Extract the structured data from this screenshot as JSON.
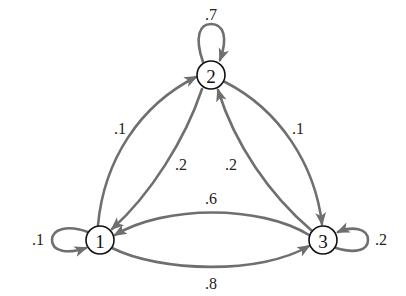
{
  "diagram": {
    "type": "markov-chain-state-diagram",
    "edge_color": "#6f6f6f",
    "node_stroke_color": "#111111",
    "nodes": [
      {
        "id": "1",
        "label": "1",
        "x": 100,
        "y": 240
      },
      {
        "id": "2",
        "label": "2",
        "x": 211,
        "y": 75
      },
      {
        "id": "3",
        "label": "3",
        "x": 323,
        "y": 240
      }
    ],
    "edges": [
      {
        "from": "2",
        "to": "2",
        "label": ".7"
      },
      {
        "from": "1",
        "to": "2",
        "label": ".1"
      },
      {
        "from": "2",
        "to": "1",
        "label": ".2"
      },
      {
        "from": "2",
        "to": "3",
        "label": ".1"
      },
      {
        "from": "3",
        "to": "2",
        "label": ".2"
      },
      {
        "from": "3",
        "to": "1",
        "label": ".6"
      },
      {
        "from": "1",
        "to": "3",
        "label": ".8"
      },
      {
        "from": "1",
        "to": "1",
        "label": ".1"
      },
      {
        "from": "3",
        "to": "3",
        "label": ".2"
      }
    ]
  }
}
